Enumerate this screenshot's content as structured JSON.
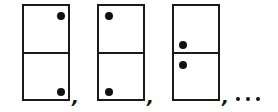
{
  "figure": {
    "colors": {
      "stroke": "#1a1a1a",
      "dot": "#111111",
      "background": "#ffffff"
    },
    "dominoes": [
      {
        "index": 1,
        "top_half_dot": "top-right",
        "bottom_half_dot": "bottom-right"
      },
      {
        "index": 2,
        "top_half_dot": "top-left",
        "bottom_half_dot": "bottom-left"
      },
      {
        "index": 3,
        "top_half_dot": "bottom-left (near divider)",
        "bottom_half_dot": "top-left (near divider)"
      }
    ],
    "separators": [
      ",",
      ",",
      ","
    ],
    "continuation": "..."
  }
}
